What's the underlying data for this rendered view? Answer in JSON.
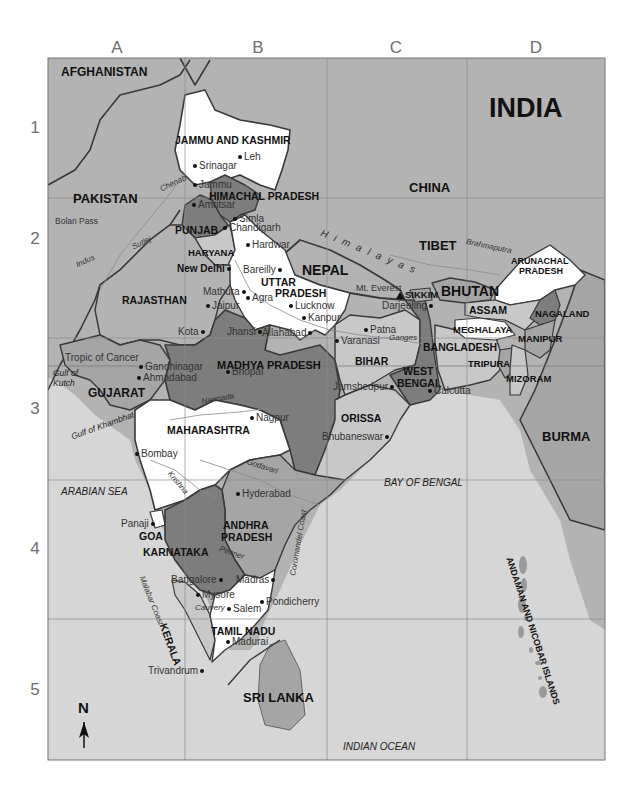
{
  "title": "INDIA",
  "grid": {
    "columns": [
      "A",
      "B",
      "C",
      "D"
    ],
    "rows": [
      "1",
      "2",
      "3",
      "4",
      "5"
    ]
  },
  "colors": {
    "ocean": "#d6d6d6",
    "foreign_land": "#b3b3b3",
    "state_white": "#ffffff",
    "state_light": "#c8c8c8",
    "state_mid": "#a5a5a5",
    "state_dark": "#7d7d7d",
    "border": "#3a3a3a",
    "grid_line": "#8c8c8c"
  },
  "countries": [
    "AFGHANISTAN",
    "PAKISTAN",
    "CHINA",
    "TIBET",
    "NEPAL",
    "BHUTAN",
    "BANGLADESH",
    "BURMA",
    "SRI LANKA"
  ],
  "states": {
    "jammu_kashmir": "JAMMU AND KASHMIR",
    "himachal": "HIMACHAL PRADESH",
    "punjab": "PUNJAB",
    "haryana": "HARYANA",
    "uttar_pradesh_1": "UTTAR",
    "uttar_pradesh_2": "PRADESH",
    "rajasthan": "RAJASTHAN",
    "gujarat": "GUJARAT",
    "madhya_pradesh": "MADHYA PRADESH",
    "bihar": "BIHAR",
    "west_bengal_1": "WEST",
    "west_bengal_2": "BENGAL",
    "sikkim": "SIKKIM",
    "arunachal_1": "ARUNACHAL",
    "arunachal_2": "PRADESH",
    "assam": "ASSAM",
    "meghalaya": "MEGHALAYA",
    "nagaland": "NAGALAND",
    "manipur": "MANIPUR",
    "tripura": "TRIPURA",
    "mizoram": "MIZORAM",
    "orissa": "ORISSA",
    "maharashtra": "MAHARASHTRA",
    "andhra_1": "ANDHRA",
    "andhra_2": "PRADESH",
    "goa": "GOA",
    "karnataka": "KARNATAKA",
    "kerala": "KERALA",
    "tamil_nadu": "TAMIL NADU",
    "andaman": "ANDAMAN AND NICOBAR ISLANDS"
  },
  "cities": {
    "leh": "Leh",
    "srinagar": "Srinagar",
    "jammu": "Jammu",
    "amritsar": "Amritsar",
    "simla": "Simla",
    "chandigarh": "Chandigarh",
    "hardwar": "Hardwar",
    "new_delhi": "New Delhi",
    "bareilly": "Bareilly",
    "mathura": "Mathura",
    "agra": "Agra",
    "jaipur": "Jaipur",
    "lucknow": "Lucknow",
    "kanpur": "Kanpur",
    "kota": "Kota",
    "jhansi": "Jhansi",
    "allahabad": "Allahabad",
    "varanasi": "Varanasi",
    "patna": "Patna",
    "darjeeling": "Darjeeling",
    "gandhinagar": "Gandhinagar",
    "ahmadabad": "Ahmadabad",
    "bhopal": "Bhopal",
    "jamshedpur": "Jamshedpur",
    "calcutta": "Calcutta",
    "nagpur": "Nagpur",
    "bhubaneswar": "Bhubaneswar",
    "bombay": "Bombay",
    "hyderabad": "Hyderabad",
    "panaji": "Panaji",
    "bangalore": "Bangalore",
    "madras": "Madras",
    "mysore": "Mysore",
    "salem": "Salem",
    "pondicherry": "Pondicherry",
    "madurai": "Madurai",
    "trivandrum": "Trivandrum"
  },
  "features": {
    "mt_everest": "Mt. Everest",
    "himalayas": "H i m a l a y a s",
    "bolan_pass": "Bolan Pass",
    "tropic": "Tropic of Cancer",
    "gulf_kutch_1": "Gulf of",
    "gulf_kutch_2": "Kutch",
    "gulf_khambhat": "Gulf of Khambhat",
    "arabian_sea": "ARABIAN SEA",
    "bay_of_bengal": "BAY OF BENGAL",
    "indian_ocean": "INDIAN OCEAN",
    "malabar_coast": "Malabar Coast",
    "coromandel_coast": "Coromandel Coast"
  },
  "rivers": {
    "chenab": "Chenab",
    "sutlej": "Sutlej",
    "indus": "Indus",
    "brahmaputra": "Brahmaputra",
    "ganges": "Ganges",
    "narmada": "Narmada",
    "godavari": "Godavari",
    "krishna": "Krishna",
    "penner": "Penner",
    "cauvery": "Cauvery"
  },
  "compass": {
    "label": "N"
  }
}
